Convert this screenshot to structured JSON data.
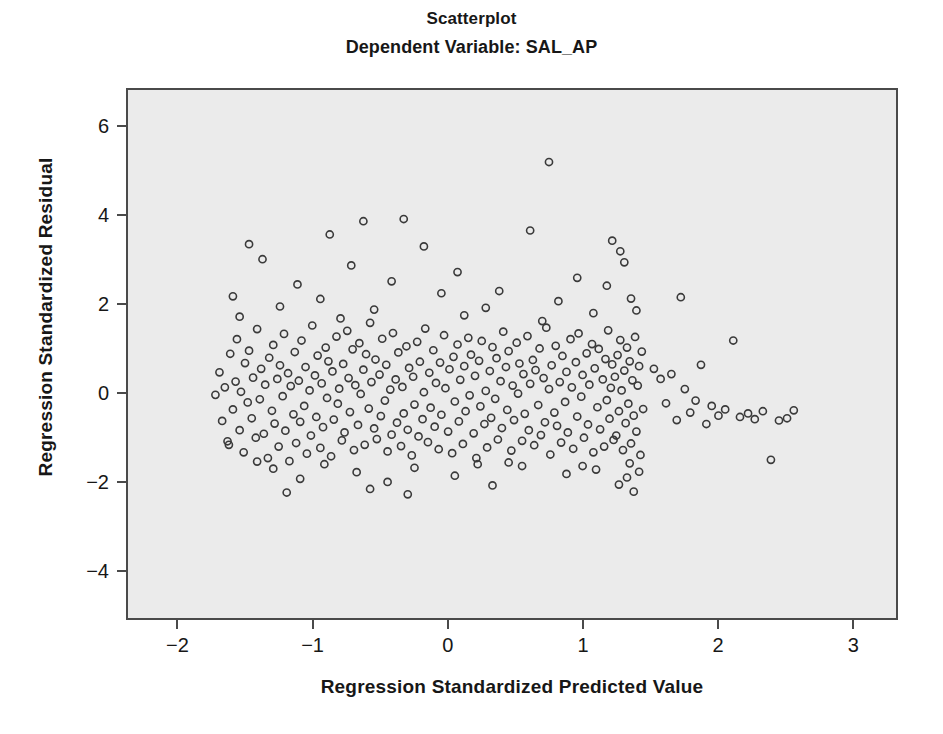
{
  "chart_data": {
    "type": "scatter",
    "title": "Scatterplot",
    "subtitle": "Dependent Variable: SAL_AP",
    "xlabel": "Regression Standardized Predicted Value",
    "ylabel": "Regression Standardized Residual",
    "xlim": [
      -2.38,
      3.33
    ],
    "ylim": [
      -5.1,
      6.85
    ],
    "xticks": [
      -2,
      -1,
      0,
      1,
      2,
      3
    ],
    "xticklabels": [
      "-2",
      "-1",
      "0",
      "1",
      "2",
      "3"
    ],
    "yticks": [
      -4,
      -2,
      0,
      2,
      4,
      6
    ],
    "yticklabels": [
      "-4",
      "-2",
      "0",
      "2",
      "4",
      "6"
    ],
    "grid": false,
    "legend": null,
    "marker": {
      "shape": "open-circle",
      "radius": 3.6,
      "stroke": "#3a3a3a",
      "stroke_width": 1.6,
      "fill": "none"
    },
    "plot_background": "#ebebeb",
    "frame_color": "#4a4a4a",
    "n_points": 820,
    "annotations": [],
    "points": [
      [
        -1.73,
        -0.05
      ],
      [
        -1.7,
        0.46
      ],
      [
        -1.68,
        -0.64
      ],
      [
        -1.66,
        0.12
      ],
      [
        -1.64,
        -1.1
      ],
      [
        -1.62,
        0.88
      ],
      [
        -1.6,
        -0.38
      ],
      [
        -1.58,
        0.25
      ],
      [
        -1.57,
        1.21
      ],
      [
        -1.55,
        -0.85
      ],
      [
        -1.54,
        0.02
      ],
      [
        -1.52,
        -1.35
      ],
      [
        -1.51,
        0.67
      ],
      [
        -1.49,
        -0.22
      ],
      [
        -1.48,
        0.95
      ],
      [
        -1.46,
        -0.58
      ],
      [
        -1.45,
        0.34
      ],
      [
        -1.43,
        -1.02
      ],
      [
        -1.42,
        1.44
      ],
      [
        -1.4,
        -0.15
      ],
      [
        -1.39,
        0.54
      ],
      [
        -1.37,
        -0.93
      ],
      [
        -1.36,
        0.18
      ],
      [
        -1.34,
        -1.48
      ],
      [
        -1.33,
        0.79
      ],
      [
        -1.31,
        -0.41
      ],
      [
        -1.3,
        1.08
      ],
      [
        -1.29,
        -0.7
      ],
      [
        -1.27,
        0.31
      ],
      [
        -1.26,
        -1.22
      ],
      [
        -1.25,
        0.62
      ],
      [
        -1.23,
        -0.08
      ],
      [
        -1.22,
        1.33
      ],
      [
        -1.21,
        -0.86
      ],
      [
        -1.19,
        0.44
      ],
      [
        -1.18,
        -1.55
      ],
      [
        -1.17,
        0.15
      ],
      [
        -1.15,
        -0.49
      ],
      [
        -1.14,
        0.92
      ],
      [
        -1.13,
        -1.14
      ],
      [
        -1.11,
        0.27
      ],
      [
        -1.1,
        -0.66
      ],
      [
        -1.09,
        1.18
      ],
      [
        -1.07,
        -0.3
      ],
      [
        -1.06,
        0.58
      ],
      [
        -1.05,
        -1.38
      ],
      [
        -1.03,
        0.05
      ],
      [
        -1.02,
        -0.97
      ],
      [
        -1.01,
        1.52
      ],
      [
        -0.99,
        0.39
      ],
      [
        -0.98,
        -0.55
      ],
      [
        -0.97,
        0.84
      ],
      [
        -0.95,
        -1.25
      ],
      [
        -0.94,
        0.21
      ],
      [
        -0.93,
        -0.78
      ],
      [
        -0.91,
        1.02
      ],
      [
        -0.9,
        -0.12
      ],
      [
        -0.89,
        0.71
      ],
      [
        -0.87,
        -1.44
      ],
      [
        -0.86,
        0.48
      ],
      [
        -0.85,
        -0.61
      ],
      [
        -0.83,
        1.27
      ],
      [
        -0.82,
        -0.25
      ],
      [
        -0.81,
        0.09
      ],
      [
        -0.79,
        -1.08
      ],
      [
        -0.78,
        0.65
      ],
      [
        -0.77,
        -0.9
      ],
      [
        -0.75,
        1.4
      ],
      [
        -0.74,
        0.33
      ],
      [
        -0.73,
        -0.44
      ],
      [
        -0.71,
        0.98
      ],
      [
        -0.7,
        -1.3
      ],
      [
        -0.69,
        0.17
      ],
      [
        -0.67,
        -0.73
      ],
      [
        -0.66,
        1.12
      ],
      [
        -0.65,
        -0.03
      ],
      [
        -0.63,
        0.52
      ],
      [
        -0.62,
        -1.18
      ],
      [
        -0.61,
        0.87
      ],
      [
        -0.59,
        -0.36
      ],
      [
        -0.58,
        1.58
      ],
      [
        -0.57,
        0.24
      ],
      [
        -0.55,
        -0.81
      ],
      [
        -0.54,
        0.75
      ],
      [
        -0.53,
        -1.05
      ],
      [
        -0.51,
        0.41
      ],
      [
        -0.5,
        -0.53
      ],
      [
        -0.49,
        1.22
      ],
      [
        -0.47,
        -0.18
      ],
      [
        -0.46,
        0.63
      ],
      [
        -0.45,
        -1.33
      ],
      [
        -0.43,
        0.07
      ],
      [
        -0.42,
        -0.95
      ],
      [
        -0.41,
        1.35
      ],
      [
        -0.39,
        0.3
      ],
      [
        -0.38,
        -0.68
      ],
      [
        -0.37,
        0.91
      ],
      [
        -0.35,
        -1.21
      ],
      [
        -0.34,
        0.13
      ],
      [
        -0.33,
        -0.47
      ],
      [
        -0.31,
        1.05
      ],
      [
        -0.3,
        -0.84
      ],
      [
        -0.29,
        0.56
      ],
      [
        -0.27,
        -1.42
      ],
      [
        -0.26,
        0.36
      ],
      [
        -0.25,
        -0.27
      ],
      [
        -0.23,
        1.15
      ],
      [
        -0.22,
        -0.99
      ],
      [
        -0.21,
        0.7
      ],
      [
        -0.19,
        -0.6
      ],
      [
        -0.18,
        0.01
      ],
      [
        -0.17,
        1.45
      ],
      [
        -0.15,
        -1.12
      ],
      [
        -0.14,
        0.45
      ],
      [
        -0.13,
        -0.34
      ],
      [
        -0.11,
        0.96
      ],
      [
        -0.1,
        -0.77
      ],
      [
        -0.09,
        0.22
      ],
      [
        -0.07,
        -1.28
      ],
      [
        -0.06,
        0.68
      ],
      [
        -0.05,
        -0.5
      ],
      [
        -0.03,
        1.3
      ],
      [
        -0.02,
        0.1
      ],
      [
        0.0,
        -0.88
      ],
      [
        0.01,
        0.53
      ],
      [
        0.03,
        -1.37
      ],
      [
        0.04,
        0.81
      ],
      [
        0.05,
        -0.2
      ],
      [
        0.07,
        1.09
      ],
      [
        0.08,
        -0.65
      ],
      [
        0.09,
        0.29
      ],
      [
        0.11,
        -1.16
      ],
      [
        0.12,
        0.6
      ],
      [
        0.13,
        -0.42
      ],
      [
        0.15,
        1.24
      ],
      [
        0.16,
        -0.06
      ],
      [
        0.17,
        0.86
      ],
      [
        0.19,
        -0.92
      ],
      [
        0.2,
        0.38
      ],
      [
        0.21,
        -1.48
      ],
      [
        0.23,
        0.72
      ],
      [
        0.24,
        -0.31
      ],
      [
        0.25,
        1.17
      ],
      [
        0.27,
        -0.71
      ],
      [
        0.28,
        0.04
      ],
      [
        0.29,
        -1.24
      ],
      [
        0.31,
        0.49
      ],
      [
        0.32,
        -0.57
      ],
      [
        0.33,
        1.03
      ],
      [
        0.35,
        -0.14
      ],
      [
        0.36,
        0.78
      ],
      [
        0.37,
        -1.06
      ],
      [
        0.39,
        0.26
      ],
      [
        0.4,
        -0.8
      ],
      [
        0.41,
        1.38
      ],
      [
        0.43,
        0.58
      ],
      [
        0.44,
        -0.39
      ],
      [
        0.45,
        0.94
      ],
      [
        0.47,
        -1.31
      ],
      [
        0.48,
        0.16
      ],
      [
        0.49,
        -0.62
      ],
      [
        0.51,
        1.13
      ],
      [
        0.52,
        -0.02
      ],
      [
        0.53,
        0.66
      ],
      [
        0.55,
        -1.09
      ],
      [
        0.56,
        0.42
      ],
      [
        0.57,
        -0.48
      ],
      [
        0.59,
        1.28
      ],
      [
        0.6,
        -0.85
      ],
      [
        0.61,
        0.2
      ],
      [
        0.63,
        0.74
      ],
      [
        0.64,
        -1.19
      ],
      [
        0.65,
        0.51
      ],
      [
        0.67,
        -0.28
      ],
      [
        0.68,
        1.0
      ],
      [
        0.69,
        -0.96
      ],
      [
        0.71,
        0.33
      ],
      [
        0.72,
        -0.67
      ],
      [
        0.73,
        1.47
      ],
      [
        0.75,
        0.08
      ],
      [
        0.76,
        -1.4
      ],
      [
        0.77,
        0.62
      ],
      [
        0.79,
        -0.45
      ],
      [
        0.8,
        1.06
      ],
      [
        0.81,
        -0.75
      ],
      [
        0.83,
        0.24
      ],
      [
        0.84,
        -1.13
      ],
      [
        0.85,
        0.83
      ],
      [
        0.87,
        -0.21
      ],
      [
        0.88,
        0.47
      ],
      [
        0.89,
        -0.9
      ],
      [
        0.91,
        1.21
      ],
      [
        0.92,
        0.12
      ],
      [
        0.93,
        -1.27
      ],
      [
        0.95,
        0.69
      ],
      [
        0.96,
        -0.54
      ],
      [
        0.97,
        1.34
      ],
      [
        0.99,
        -0.09
      ],
      [
        1.0,
        0.4
      ],
      [
        1.01,
        -1.02
      ],
      [
        1.03,
        0.89
      ],
      [
        1.04,
        -0.72
      ],
      [
        1.05,
        0.18
      ],
      [
        1.07,
        1.1
      ],
      [
        1.08,
        -1.35
      ],
      [
        1.09,
        0.55
      ],
      [
        1.11,
        -0.33
      ],
      [
        1.12,
        0.99
      ],
      [
        1.13,
        -0.83
      ],
      [
        1.15,
        0.3
      ],
      [
        1.16,
        -1.22
      ],
      [
        1.17,
        0.76
      ],
      [
        1.18,
        -0.17
      ],
      [
        1.19,
        1.41
      ],
      [
        1.2,
        -0.59
      ],
      [
        1.21,
        0.11
      ],
      [
        1.22,
        0.64
      ],
      [
        1.23,
        -1.07
      ],
      [
        1.24,
        0.36
      ],
      [
        1.25,
        -0.97
      ],
      [
        1.26,
        0.85
      ],
      [
        1.27,
        -0.42
      ],
      [
        1.28,
        1.19
      ],
      [
        1.29,
        0.05
      ],
      [
        1.3,
        -1.3
      ],
      [
        1.31,
        0.5
      ],
      [
        1.32,
        -0.69
      ],
      [
        1.33,
        1.02
      ],
      [
        1.34,
        -0.25
      ],
      [
        1.35,
        0.71
      ],
      [
        1.36,
        -1.15
      ],
      [
        1.37,
        0.28
      ],
      [
        1.38,
        -0.52
      ],
      [
        1.39,
        1.26
      ],
      [
        1.4,
        -0.88
      ],
      [
        1.41,
        0.16
      ],
      [
        1.42,
        0.6
      ],
      [
        1.43,
        -1.41
      ],
      [
        1.44,
        0.93
      ],
      [
        1.45,
        -0.37
      ],
      [
        1.53,
        0.54
      ],
      [
        1.58,
        0.31
      ],
      [
        1.62,
        -0.24
      ],
      [
        1.66,
        0.42
      ],
      [
        1.7,
        -0.62
      ],
      [
        1.73,
        2.16
      ],
      [
        1.76,
        0.08
      ],
      [
        1.8,
        -0.45
      ],
      [
        1.84,
        -0.18
      ],
      [
        1.88,
        0.63
      ],
      [
        1.92,
        -0.71
      ],
      [
        1.96,
        -0.3
      ],
      [
        2.01,
        -0.52
      ],
      [
        2.06,
        -0.38
      ],
      [
        2.12,
        1.18
      ],
      [
        2.17,
        -0.55
      ],
      [
        2.23,
        -0.47
      ],
      [
        2.28,
        -0.6
      ],
      [
        2.34,
        -0.42
      ],
      [
        2.4,
        -1.52
      ],
      [
        2.46,
        -0.63
      ],
      [
        2.52,
        -0.58
      ],
      [
        2.57,
        -0.4
      ],
      [
        0.75,
        5.22
      ],
      [
        -0.33,
        3.93
      ],
      [
        -0.63,
        3.88
      ],
      [
        0.61,
        3.67
      ],
      [
        1.22,
        3.44
      ],
      [
        -1.48,
        3.36
      ],
      [
        -0.88,
        3.58
      ],
      [
        -0.18,
        3.31
      ],
      [
        1.28,
        3.2
      ],
      [
        -1.38,
        3.02
      ],
      [
        -0.72,
        2.88
      ],
      [
        0.07,
        2.73
      ],
      [
        0.96,
        2.6
      ],
      [
        1.31,
        2.95
      ],
      [
        -1.12,
        2.45
      ],
      [
        -0.42,
        2.52
      ],
      [
        0.38,
        2.3
      ],
      [
        1.18,
        2.42
      ],
      [
        -1.6,
        2.18
      ],
      [
        -0.95,
        2.12
      ],
      [
        -0.05,
        2.25
      ],
      [
        0.82,
        2.07
      ],
      [
        1.36,
        2.13
      ],
      [
        -1.25,
        1.95
      ],
      [
        -0.55,
        1.88
      ],
      [
        0.28,
        1.92
      ],
      [
        1.08,
        1.8
      ],
      [
        1.4,
        1.86
      ],
      [
        -1.55,
        1.72
      ],
      [
        -0.8,
        1.68
      ],
      [
        0.12,
        1.75
      ],
      [
        0.7,
        1.62
      ],
      [
        -1.3,
        -1.72
      ],
      [
        -0.68,
        -1.8
      ],
      [
        0.05,
        -1.88
      ],
      [
        0.55,
        -1.66
      ],
      [
        1.1,
        -1.74
      ],
      [
        1.33,
        -1.92
      ],
      [
        -1.1,
        -1.95
      ],
      [
        -0.45,
        -2.02
      ],
      [
        0.22,
        -1.62
      ],
      [
        0.88,
        -1.84
      ],
      [
        1.27,
        -2.08
      ],
      [
        1.42,
        -1.79
      ],
      [
        -1.2,
        -2.26
      ],
      [
        -0.58,
        -2.18
      ],
      [
        0.33,
        -2.1
      ],
      [
        1.38,
        -2.24
      ],
      [
        -1.42,
        -1.56
      ],
      [
        -0.92,
        -1.62
      ],
      [
        -0.25,
        -1.7
      ],
      [
        0.45,
        -1.58
      ],
      [
        1.0,
        -1.66
      ],
      [
        1.35,
        -1.6
      ],
      [
        -1.63,
        -1.18
      ],
      [
        -0.3,
        -2.3
      ]
    ]
  }
}
